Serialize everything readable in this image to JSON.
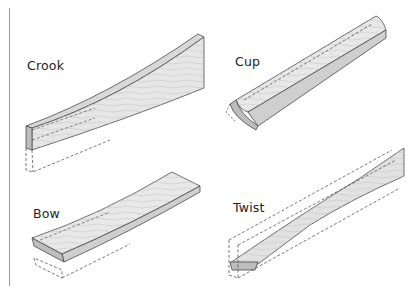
{
  "labels": {
    "crook": "Crook",
    "cup": "Cup",
    "bow": "Bow",
    "twist": "Twist"
  },
  "colors": {
    "wood_face": "#e4e4e4",
    "wood_edge": "#bdbdbd",
    "outline": "#4a4a4a",
    "dashed": "#555555",
    "rule": "#9a9a9a"
  }
}
